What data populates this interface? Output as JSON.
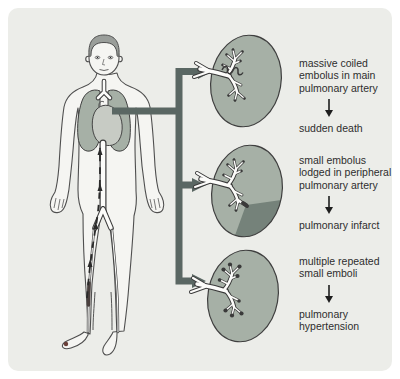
{
  "outcomes": [
    {
      "cause": "massive coiled embolus in main pulmonary artery",
      "result": "sudden death"
    },
    {
      "cause": "small embolus lodged in peripheral pulmonary artery",
      "result": "pulmonary infarct"
    },
    {
      "cause": "multiple repeated small emboli",
      "result": "pulmonary hypertension"
    }
  ],
  "icons": {
    "down_arrow": "↓",
    "branch_arrow": "→"
  },
  "colors": {
    "page_bg": "#ffffff",
    "panel_bg": "#ecede9",
    "lung_fill": "#a6b0a6",
    "infarct_fill": "#75827a",
    "connector": "#5a6763",
    "text": "#2e2e2e"
  }
}
